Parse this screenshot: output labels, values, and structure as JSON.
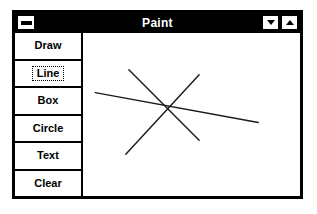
{
  "window": {
    "title": "Paint",
    "sysmenu_icon": "minimize-box-icon",
    "controls": [
      {
        "name": "minimize",
        "icon": "triangle-down-icon",
        "label": ""
      },
      {
        "name": "maximize",
        "icon": "triangle-up-icon",
        "label": ""
      }
    ]
  },
  "toolbar": {
    "buttons": [
      {
        "label": "Draw",
        "selected": false
      },
      {
        "label": "Line",
        "selected": true
      },
      {
        "label": "Box",
        "selected": false
      },
      {
        "label": "Circle",
        "selected": false
      },
      {
        "label": "Text",
        "selected": false
      },
      {
        "label": "Clear",
        "selected": false
      }
    ]
  },
  "canvas": {
    "background": "#ffffff",
    "stroke_color": "#1a1a1a",
    "stroke_width": 1.4,
    "viewbox": {
      "width": 213,
      "height": 164
    },
    "shapes": [
      {
        "type": "line",
        "name": "line-horizontal",
        "x1": 12,
        "y1": 60,
        "x2": 172,
        "y2": 90
      },
      {
        "type": "line",
        "name": "line-diagonal-down",
        "x1": 45,
        "y1": 37,
        "x2": 114,
        "y2": 108
      },
      {
        "type": "line",
        "name": "line-diagonal-up",
        "x1": 42,
        "y1": 122,
        "x2": 114,
        "y2": 42
      }
    ]
  }
}
